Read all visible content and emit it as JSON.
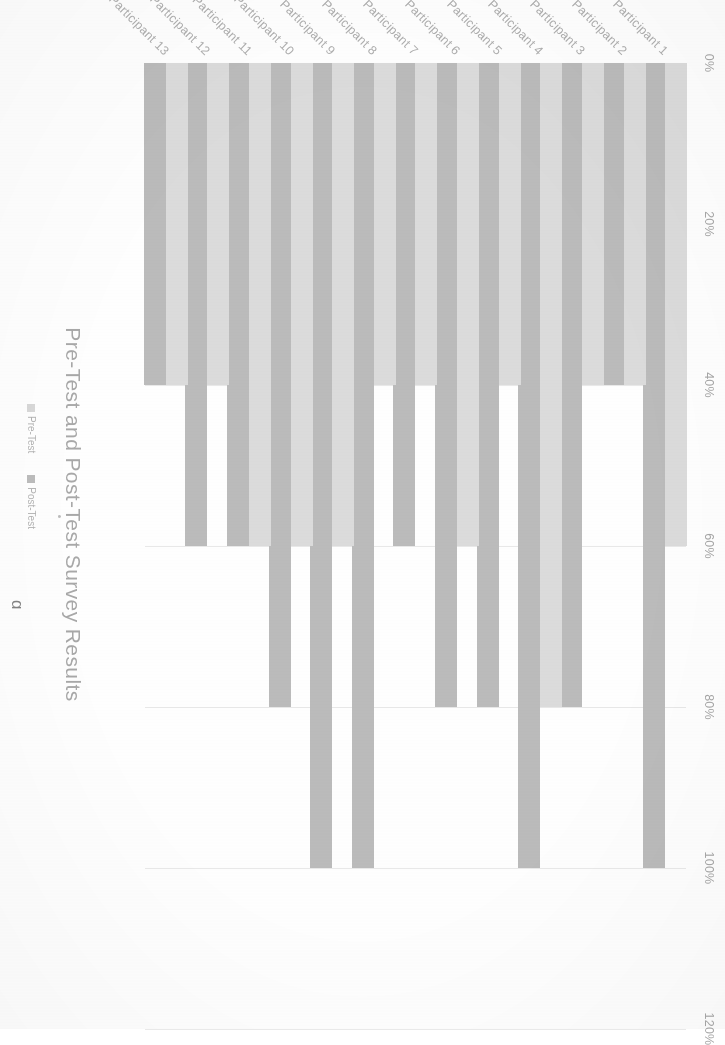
{
  "document": {
    "type": "scanned-chart-page",
    "orientation": "rotated-90-clockwise"
  },
  "chart": {
    "title": "Pre-Test and Post-Test Survey Results",
    "cut_off_heading_fragment": "g",
    "legend": {
      "position": "bottom-left",
      "entries": [
        {
          "label": "Pre-Test",
          "color": "#d9d9d9"
        },
        {
          "label": "Post-Test",
          "color": "#bdbdbd"
        }
      ]
    },
    "axis": {
      "value_axis_position": "top",
      "tick_labels": [
        "0%",
        "20%",
        "40%",
        "60%",
        "80%",
        "100%",
        "120%"
      ],
      "tick_values": [
        0,
        20,
        40,
        60,
        80,
        100,
        120
      ],
      "gridlines": true
    },
    "colors": {
      "pre_test": "#dcdcdc",
      "post_test": "#bcbcbc",
      "gridline": "#e9e9e9",
      "text": "#b0b0b0",
      "title": "#a9a9a9",
      "background": "#ffffff"
    }
  },
  "chart_data": {
    "type": "bar",
    "orientation": "horizontal",
    "title": "Pre-Test and Post-Test Survey Results",
    "xlabel": "",
    "ylabel": "",
    "xlim": [
      0,
      120
    ],
    "xticks": [
      0,
      20,
      40,
      60,
      80,
      100,
      120
    ],
    "xticklabels": [
      "0%",
      "20%",
      "40%",
      "60%",
      "80%",
      "100%",
      "120%"
    ],
    "grid": true,
    "legend_position": "bottom-left",
    "categories": [
      "Participant 1",
      "Participant 2",
      "Participant 3",
      "Participant 4",
      "Participant 5",
      "Participant 6",
      "Participant 7",
      "Participant 8",
      "Participant 9",
      "Participant 10",
      "Participant 11",
      "Participant 12",
      "Participant 13"
    ],
    "series": [
      {
        "name": "Pre-Test",
        "color": "#dcdcdc",
        "values": [
          60,
          40,
          40,
          80,
          40,
          60,
          40,
          40,
          60,
          60,
          60,
          40,
          40
        ]
      },
      {
        "name": "Post-Test",
        "color": "#bcbcbc",
        "values": [
          100,
          40,
          80,
          100,
          80,
          80,
          60,
          100,
          100,
          80,
          60,
          60,
          40
        ]
      }
    ]
  }
}
